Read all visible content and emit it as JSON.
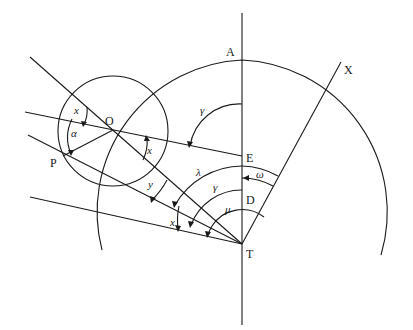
{
  "figure": {
    "type": "geometry-diagram",
    "points": {
      "A": {
        "label": "A",
        "x": 242,
        "y": 60
      },
      "E": {
        "label": "E",
        "x": 242,
        "y": 156
      },
      "D": {
        "label": "D",
        "x": 242,
        "y": 200
      },
      "T": {
        "label": "T",
        "x": 242,
        "y": 244
      },
      "O": {
        "label": "O",
        "x": 113,
        "y": 130
      },
      "P": {
        "label": "P",
        "x": 63,
        "y": 156
      },
      "X": {
        "label": "X",
        "x": 340,
        "y": 62
      }
    },
    "angle_labels": {
      "x_top": "x",
      "alpha": "α",
      "x_right": "x",
      "gamma_top": "γ",
      "y": "y",
      "lambda": "λ",
      "gamma_mid": "γ",
      "omega": "ω",
      "mu": "μ",
      "x_bottom": "x"
    }
  }
}
